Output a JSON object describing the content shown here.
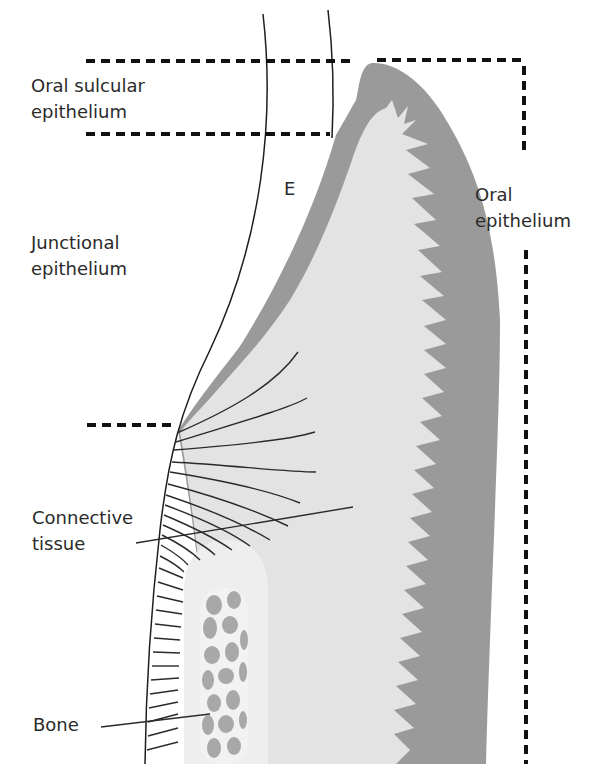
{
  "figure": {
    "type": "anatomical-diagram"
  },
  "labels": {
    "oral_sulcular_epithelium": [
      "Oral sulcular",
      "epithelium"
    ],
    "junctional_epithelium": [
      "Junctional",
      "epithelium"
    ],
    "connective_tissue": [
      "Connective",
      "tissue"
    ],
    "bone": [
      "Bone"
    ],
    "oral_epithelium": [
      "Oral",
      "epithelium"
    ],
    "enamel": "E"
  },
  "colors": {
    "background": "#ffffff",
    "epithelium": "#9a9a9a",
    "connective_tissue": "#e3e3e3",
    "bone_inner_zone": "#eeeeee",
    "bone_trabeculae": "#a8a8a8",
    "lines": "#1e1e1e",
    "dashed_lines": "#111111"
  }
}
